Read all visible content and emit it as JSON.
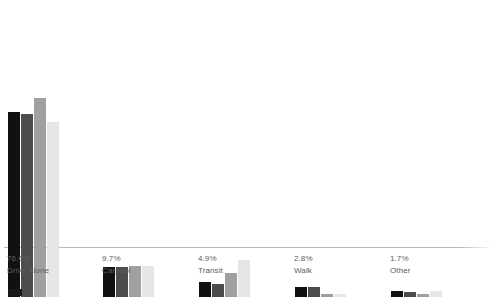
{
  "chart_data": {
    "type": "bar",
    "title": "",
    "subtitle": "",
    "xlabel": "",
    "ylabel": "",
    "grid": false,
    "legend_position": "bottom-left",
    "axis_range": [
      0,
      100
    ],
    "categories": [
      "Drive Alone",
      "Carpool",
      "Transit",
      "Walk",
      "Other"
    ],
    "category_values": [
      "76.6%",
      "9.7%",
      "4.9%",
      "2.8%",
      "1.7%"
    ],
    "series": [
      {
        "name": "series-1",
        "color": "#111111",
        "values": [
          74.6,
          12.0,
          6.0,
          3.8,
          2.2
        ]
      },
      {
        "name": "series-2",
        "color": "#4d4d4d",
        "values": [
          73.8,
          12.2,
          5.2,
          3.8,
          2.0
        ]
      },
      {
        "name": "series-3",
        "color": "#a0a0a0",
        "values": [
          80.2,
          12.4,
          9.6,
          1.0,
          1.0
        ]
      },
      {
        "name": "series-4",
        "color": "#e6e6e6",
        "values": [
          70.4,
          12.6,
          15.0,
          1.2,
          2.4
        ]
      }
    ],
    "bars": [
      {
        "category": "Drive Alone",
        "value_label": "76.6%",
        "left": 8,
        "label_left": 7,
        "series": [
          {
            "name": "series-1",
            "color": "#111111",
            "height": 185
          },
          {
            "name": "series-2",
            "color": "#4d4d4d",
            "height": 183
          },
          {
            "name": "series-3",
            "color": "#a0a0a0",
            "height": 199
          },
          {
            "name": "series-4",
            "color": "#e6e6e6",
            "height": 175
          }
        ]
      },
      {
        "category": "Carpool",
        "value_label": "9.7%",
        "left": 103,
        "label_left": 102,
        "series": [
          {
            "name": "series-1",
            "color": "#111111",
            "height": 30
          },
          {
            "name": "series-2",
            "color": "#4d4d4d",
            "height": 30
          },
          {
            "name": "series-3",
            "color": "#a0a0a0",
            "height": 31
          },
          {
            "name": "series-4",
            "color": "#e6e6e6",
            "height": 31
          }
        ]
      },
      {
        "category": "Transit",
        "value_label": "4.9%",
        "left": 199,
        "label_left": 198,
        "series": [
          {
            "name": "series-1",
            "color": "#111111",
            "height": 15
          },
          {
            "name": "series-2",
            "color": "#4d4d4d",
            "height": 13
          },
          {
            "name": "series-3",
            "color": "#a0a0a0",
            "height": 24
          },
          {
            "name": "series-4",
            "color": "#e6e6e6",
            "height": 37
          }
        ]
      },
      {
        "category": "Walk",
        "value_label": "2.8%",
        "left": 295,
        "label_left": 294,
        "series": [
          {
            "name": "series-1",
            "color": "#111111",
            "height": 10
          },
          {
            "name": "series-2",
            "color": "#4d4d4d",
            "height": 10
          },
          {
            "name": "series-3",
            "color": "#a0a0a0",
            "height": 3
          },
          {
            "name": "series-4",
            "color": "#e6e6e6",
            "height": 3
          }
        ]
      },
      {
        "category": "Other",
        "value_label": "1.7%",
        "left": 391,
        "label_left": 390,
        "series": [
          {
            "name": "series-1",
            "color": "#111111",
            "height": 6
          },
          {
            "name": "series-2",
            "color": "#4d4d4d",
            "height": 5
          },
          {
            "name": "series-3",
            "color": "#a0a0a0",
            "height": 3
          },
          {
            "name": "series-4",
            "color": "#e6e6e6",
            "height": 6
          }
        ]
      }
    ],
    "legend": [
      {
        "label": "",
        "color": "#1a1a1a"
      }
    ]
  }
}
